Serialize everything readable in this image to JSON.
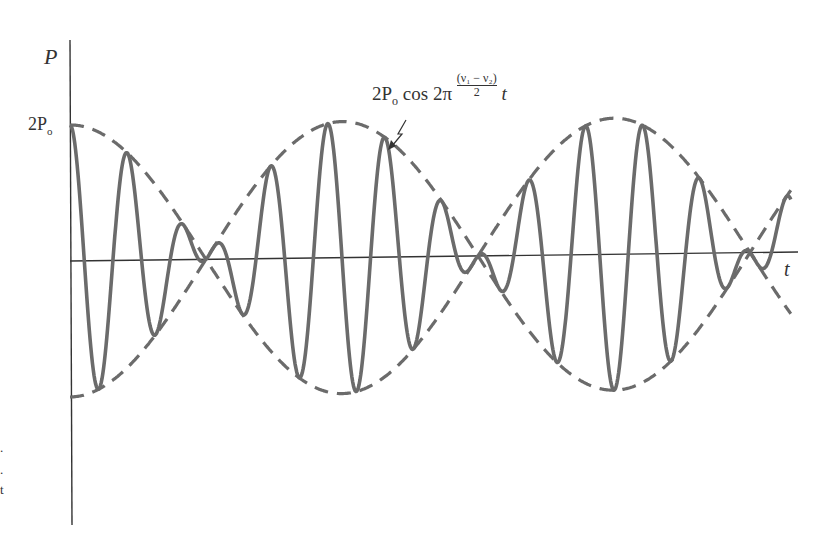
{
  "chart_data": {
    "type": "line",
    "title": "",
    "xlabel": "t",
    "ylabel": "P",
    "y_ticks": [
      {
        "label": "2P_o",
        "value": 2
      }
    ],
    "grid": false,
    "legend": null,
    "annotation": "2 P_o cos 2π (ν1 − ν2)/2 t",
    "series": [
      {
        "name": "pressure P(t)",
        "style": "solid",
        "amplitude": 2,
        "carrier_cycles_per_beat_half": 5,
        "beat_half_periods": 2.65
      },
      {
        "name": "upper envelope 2P_o cos 2π((ν1−ν2)/2)t",
        "style": "dashed"
      },
      {
        "name": "lower envelope −2P_o cos 2π((ν1−ν2)/2)t",
        "style": "dashed"
      }
    ],
    "envelope_nodes_t": [
      0.5,
      1.5,
      2.5
    ],
    "envelope_peaks_t": [
      0,
      1,
      2
    ],
    "xlim": [
      0,
      2.65
    ],
    "ylim": [
      -2.9,
      3.2
    ]
  },
  "labels": {
    "y_axis": "P",
    "x_axis": "t",
    "tick_2p": "2P",
    "tick_2p_sub": "o",
    "formula_prefix": "2P",
    "formula_sub": "o",
    "formula_mid": " cos 2π",
    "formula_num": "(ν₁ − ν₂)",
    "formula_den": "2",
    "formula_suffix": "t"
  },
  "edge_fragments": [
    ".",
    ".",
    "t"
  ],
  "colors": {
    "curve": "#6b6b6b",
    "axis": "#333333",
    "background": "#ffffff"
  }
}
